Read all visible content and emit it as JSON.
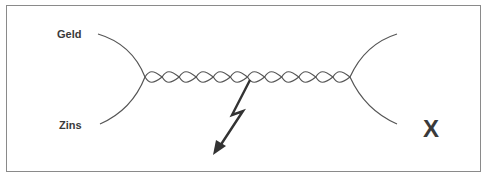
{
  "diagram": {
    "labels": {
      "top_left": "Geld",
      "bottom_left": "Zins",
      "right_mark": "X"
    },
    "elements": {
      "strands": "two twisted strands (helix) connecting left and right forks",
      "twist_count": 12,
      "break_symbol": "lightning-bolt-arrow",
      "fork_left": "strands diverge to Geld (top) and Zins (bottom)",
      "fork_right": "strands diverge with no labels"
    },
    "colors": {
      "stroke": "#555555",
      "text": "#3a3a3a",
      "border": "#8a8a8a",
      "background": "#ffffff"
    }
  }
}
